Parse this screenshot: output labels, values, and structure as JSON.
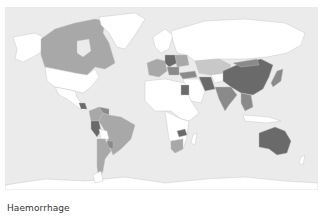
{
  "caption": "Haemorrhage",
  "map": {
    "type": "choropleth",
    "projection": "world",
    "colors": {
      "ocean": "#ebebeb",
      "no_data": "#ffffff",
      "level_1": "#c8c8c8",
      "level_2": "#a8a8a8",
      "level_3": "#8a8a8a",
      "level_4": "#6a6a6a"
    },
    "shaded_regions": [
      {
        "name": "Canada",
        "level": 2
      },
      {
        "name": "Mexico/Central America",
        "level": 1
      },
      {
        "name": "Guatemala",
        "level": 4
      },
      {
        "name": "Venezuela",
        "level": 3
      },
      {
        "name": "Colombia",
        "level": 2
      },
      {
        "name": "Peru",
        "level": 4
      },
      {
        "name": "Brazil",
        "level": 2
      },
      {
        "name": "Argentina",
        "level": 2
      },
      {
        "name": "Paraguay",
        "level": 3
      },
      {
        "name": "Western Europe",
        "level": 2
      },
      {
        "name": "Central Europe",
        "level": 4
      },
      {
        "name": "Turkey",
        "level": 3
      },
      {
        "name": "Kazakhstan",
        "level": 1
      },
      {
        "name": "Iran",
        "level": 4
      },
      {
        "name": "China",
        "level": 4
      },
      {
        "name": "India",
        "level": 3
      },
      {
        "name": "Japan",
        "level": 3
      },
      {
        "name": "Southeast Asia",
        "level": 3
      },
      {
        "name": "Egypt",
        "level": 4
      },
      {
        "name": "Zambia",
        "level": 4
      },
      {
        "name": "Southern Africa",
        "level": 2
      },
      {
        "name": "Australia",
        "level": 4
      }
    ]
  }
}
